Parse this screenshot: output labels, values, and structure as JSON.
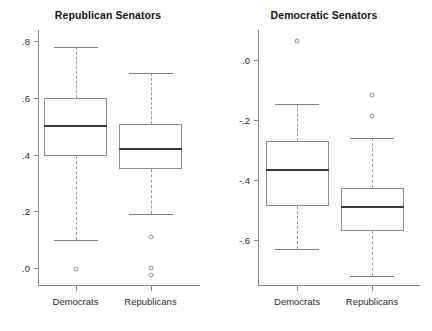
{
  "figure": {
    "width": 432,
    "height": 331,
    "background": "#ffffff",
    "line_color": "#8a8a8a",
    "median_color": "#3a3a3a"
  },
  "panels": [
    {
      "name": "republican-senators",
      "title": "Republican Senators",
      "ylim": [
        -0.06,
        0.84
      ],
      "yticks": [
        0.0,
        0.2,
        0.4,
        0.6,
        0.8
      ],
      "ytick_labels": [
        ".0",
        ".2",
        ".4",
        ".6",
        ".8"
      ],
      "categories": [
        "Democrats",
        "Republicans"
      ],
      "boxes": [
        {
          "category": "Democrats",
          "whisker_low": 0.1,
          "q1": 0.395,
          "median": 0.5,
          "q3": 0.6,
          "whisker_high": 0.78,
          "outliers": [
            -0.005
          ]
        },
        {
          "category": "Republicans",
          "whisker_low": 0.19,
          "q1": 0.35,
          "median": 0.42,
          "q3": 0.51,
          "whisker_high": 0.69,
          "outliers": [
            0.11,
            0.0,
            -0.025
          ]
        }
      ]
    },
    {
      "name": "democratic-senators",
      "title": "Democratic Senators",
      "ylim": [
        -0.75,
        0.1
      ],
      "yticks": [
        0.0,
        -0.2,
        -0.4,
        -0.6
      ],
      "ytick_labels": [
        ".0",
        "-.2",
        "-.4",
        "-.6"
      ],
      "categories": [
        "Democrats",
        "Republicans"
      ],
      "boxes": [
        {
          "category": "Democrats",
          "whisker_low": -0.63,
          "q1": -0.485,
          "median": -0.365,
          "q3": -0.27,
          "whisker_high": -0.145,
          "outliers": [
            0.065
          ]
        },
        {
          "category": "Republicans",
          "whisker_low": -0.72,
          "q1": -0.57,
          "median": -0.49,
          "q3": -0.425,
          "whisker_high": -0.26,
          "outliers": [
            -0.115,
            -0.185
          ]
        }
      ]
    }
  ],
  "chart_data": {
    "type": "box",
    "panels": [
      {
        "title": "Republican Senators",
        "ylabel": "",
        "xlabel": "",
        "ylim": [
          -0.06,
          0.84
        ],
        "ytick_labels": [
          ".0",
          ".2",
          ".4",
          ".6",
          ".8"
        ],
        "categories": [
          "Democrats",
          "Republicans"
        ],
        "series": [
          {
            "name": "Democrats",
            "min_whisker": 0.1,
            "q1": 0.395,
            "median": 0.5,
            "q3": 0.6,
            "max_whisker": 0.78,
            "outliers": [
              -0.005
            ]
          },
          {
            "name": "Republicans",
            "min_whisker": 0.19,
            "q1": 0.35,
            "median": 0.42,
            "q3": 0.51,
            "max_whisker": 0.69,
            "outliers": [
              0.11,
              0.0,
              -0.025
            ]
          }
        ]
      },
      {
        "title": "Democratic Senators",
        "ylabel": "",
        "xlabel": "",
        "ylim": [
          -0.75,
          0.1
        ],
        "ytick_labels": [
          ".0",
          "-.2",
          "-.4",
          "-.6"
        ],
        "categories": [
          "Democrats",
          "Republicans"
        ],
        "series": [
          {
            "name": "Democrats",
            "min_whisker": -0.63,
            "q1": -0.485,
            "median": -0.365,
            "q3": -0.27,
            "max_whisker": -0.145,
            "outliers": [
              0.065
            ]
          },
          {
            "name": "Republicans",
            "min_whisker": -0.72,
            "q1": -0.57,
            "median": -0.49,
            "q3": -0.425,
            "max_whisker": -0.26,
            "outliers": [
              -0.115,
              -0.185
            ]
          }
        ]
      }
    ],
    "grid": false,
    "legend": "none"
  }
}
